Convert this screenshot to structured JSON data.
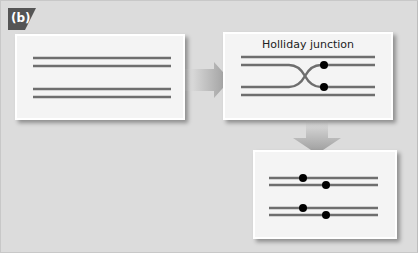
{
  "figure": {
    "panel_label": "(b)",
    "colors": {
      "background": "#dcdcdc",
      "box_fill": "#f4f4f4",
      "strand": "#6e6e6e",
      "label_tab": "#555555",
      "dot": "#000000",
      "arrow": "#a8a8a8"
    }
  },
  "stages": [
    {
      "id": "parallel-duplexes",
      "title": ""
    },
    {
      "id": "holliday-junction",
      "title": "Holliday junction"
    },
    {
      "id": "resolved-duplexes",
      "title": ""
    }
  ],
  "arrows": [
    {
      "from": "parallel-duplexes",
      "to": "holliday-junction",
      "direction": "right"
    },
    {
      "from": "holliday-junction",
      "to": "resolved-duplexes",
      "direction": "down"
    }
  ]
}
